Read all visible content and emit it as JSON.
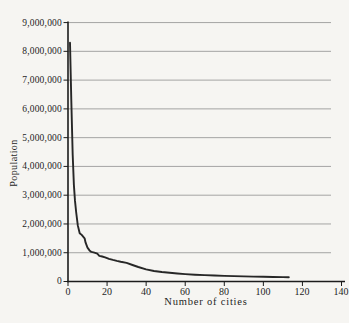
{
  "figure": {
    "background": "#f6f5f2"
  },
  "chart_data": {
    "type": "line",
    "title": "",
    "xlabel": "Number of cities",
    "ylabel": "Population",
    "xlim": [
      0,
      140
    ],
    "ylim": [
      0,
      9000000
    ],
    "grid": "horizontal",
    "legend": "none",
    "axis_color": "#1c1c1c",
    "grid_color": "#9b9b9b",
    "line_color": "#272727",
    "xticks": [
      0,
      20,
      40,
      60,
      80,
      100,
      120,
      140
    ],
    "xtick_labels": [
      "0",
      "20",
      "40",
      "60",
      "80",
      "100",
      "120",
      "140"
    ],
    "yticks": [
      0,
      1000000,
      2000000,
      3000000,
      4000000,
      5000000,
      6000000,
      7000000,
      8000000,
      9000000
    ],
    "ytick_labels": [
      "0",
      "1,000,000",
      "2,000,000",
      "3,000,000",
      "4,000,000",
      "5,000,000",
      "6,000,000",
      "7,000,000",
      "8,000,000",
      "9,000,000"
    ],
    "series": [
      {
        "name": "city-population-by-rank",
        "points": [
          [
            1,
            8300000
          ],
          [
            1.7,
            6300000
          ],
          [
            2.4,
            4400000
          ],
          [
            3,
            3350000
          ],
          [
            3.6,
            2800000
          ],
          [
            4.2,
            2400000
          ],
          [
            5,
            1950000
          ],
          [
            6,
            1680000
          ],
          [
            7,
            1620000
          ],
          [
            8.5,
            1500000
          ],
          [
            9,
            1350000
          ],
          [
            10,
            1180000
          ],
          [
            11,
            1080000
          ],
          [
            12,
            1030000
          ],
          [
            13.5,
            1000000
          ],
          [
            15,
            965000
          ],
          [
            16,
            895000
          ],
          [
            17.5,
            870000
          ],
          [
            19,
            840000
          ],
          [
            21,
            790000
          ],
          [
            23,
            750000
          ],
          [
            25,
            715000
          ],
          [
            27,
            685000
          ],
          [
            30,
            645000
          ],
          [
            33,
            575000
          ],
          [
            36,
            505000
          ],
          [
            40,
            420000
          ],
          [
            44,
            365000
          ],
          [
            48,
            330000
          ],
          [
            52,
            302000
          ],
          [
            56,
            278000
          ],
          [
            60,
            257000
          ],
          [
            65,
            237000
          ],
          [
            70,
            221000
          ],
          [
            75,
            208000
          ],
          [
            80,
            196000
          ],
          [
            85,
            186000
          ],
          [
            90,
            177000
          ],
          [
            95,
            169000
          ],
          [
            100,
            163000
          ],
          [
            105,
            157000
          ],
          [
            110,
            152000
          ],
          [
            113,
            150000
          ]
        ]
      }
    ]
  }
}
